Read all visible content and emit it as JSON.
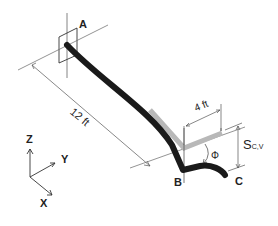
{
  "diagram": {
    "points": {
      "A": "A",
      "B": "B",
      "C": "C"
    },
    "dimensions": {
      "length_ab": "12 ft",
      "length_bc": "4 ft",
      "deflection_symbol": "S",
      "deflection_subscript": "C,V",
      "angle_symbol": "Φ"
    },
    "axes": {
      "z": "Z",
      "y": "Y",
      "x": "X"
    },
    "colors": {
      "rod": "#1a1a1a",
      "undeformed": "#b8b8b8",
      "lines": "#555555"
    }
  }
}
